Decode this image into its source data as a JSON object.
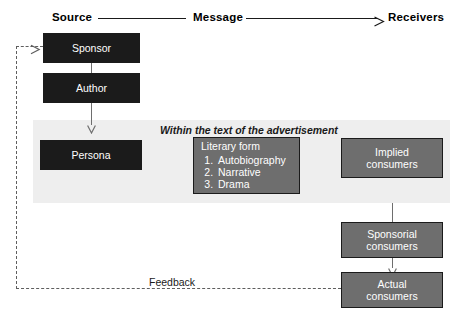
{
  "header": {
    "source_label": "Source",
    "message_label": "Message",
    "receivers_label": "Receivers",
    "arrow_icon": "arrow-right-icon"
  },
  "band": {
    "caption": "Within the text of the advertisement",
    "fill_color": "#eeeeee"
  },
  "colors": {
    "dark_box": "#1b1b1b",
    "mid_box": "#6e6e6e",
    "box_text": "#ffffff",
    "connector": "#6e6e6e",
    "feedback_line": "#5e5e5e",
    "text": "#1a1a1a"
  },
  "boxes": {
    "sponsor": {
      "label": "Sponsor"
    },
    "author": {
      "label": "Author"
    },
    "persona": {
      "label": "Persona"
    },
    "literary_form": {
      "title": "Literary form",
      "items": [
        "Autobiography",
        "Narrative",
        "Drama"
      ]
    },
    "implied_consumers": {
      "line1": "Implied",
      "line2": "consumers"
    },
    "sponsorial_consumers": {
      "line1": "Sponsorial",
      "line2": "consumers"
    },
    "actual_consumers": {
      "line1": "Actual",
      "line2": "consumers"
    }
  },
  "feedback": {
    "label": "Feedback",
    "arrow_icon": "arrow-right-icon"
  }
}
